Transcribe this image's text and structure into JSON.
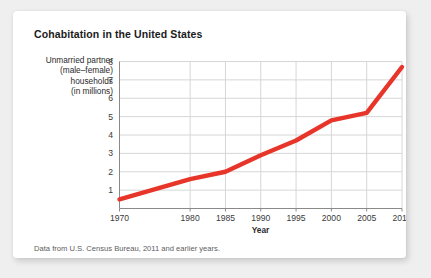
{
  "card": {
    "title": "Cohabitation in the United States",
    "source_note": "Data from U.S. Census Bureau, 2011 and earlier years."
  },
  "chart_data": {
    "type": "line",
    "title": "Cohabitation in the United States",
    "xlabel": "Year",
    "ylabel": "Unmarried partner (male–female) households (in millions)",
    "ylabel_lines": [
      "Unmarried partner",
      "(male–female)",
      "households",
      "(in millions)"
    ],
    "x": [
      1970,
      1980,
      1985,
      1990,
      1995,
      2000,
      2005,
      2010
    ],
    "values": [
      0.5,
      1.6,
      2.0,
      2.9,
      3.7,
      4.8,
      5.2,
      7.7
    ],
    "xticklabels": [
      "1970",
      "1980",
      "1985",
      "1990",
      "1995",
      "2000",
      "2005",
      "2010"
    ],
    "yticklabels": [
      "1",
      "2",
      "3",
      "4",
      "5",
      "6",
      "7",
      "8"
    ],
    "ytickvalues": [
      1,
      2,
      3,
      4,
      5,
      6,
      7,
      8
    ],
    "ylim": [
      0,
      8
    ],
    "xlim": [
      1970,
      2010
    ],
    "grid": true,
    "legend": false,
    "line_color": "#E8352A",
    "grid_color": "#D6D6D6",
    "axis_color": "#8A8A8A"
  }
}
